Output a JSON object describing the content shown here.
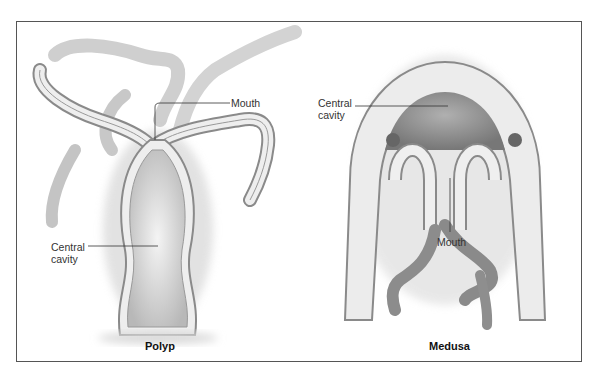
{
  "figure": {
    "panels": [
      {
        "id": "polyp",
        "title": "Polyp",
        "labels": {
          "mouth": "Mouth",
          "central_cavity_line1": "Central",
          "central_cavity_line2": "cavity"
        }
      },
      {
        "id": "medusa",
        "title": "Medusa",
        "labels": {
          "mouth": "Mouth",
          "central_cavity_line1": "Central",
          "central_cavity_line2": "cavity"
        }
      }
    ]
  },
  "colors": {
    "frame": "#555555",
    "tissue_outer": "#e6e6e6",
    "tissue_inner": "#8a8a8a",
    "cavity": "#cfcfcf",
    "medusa_cavity": "#9a9a9a",
    "leader_line": "#333333"
  }
}
